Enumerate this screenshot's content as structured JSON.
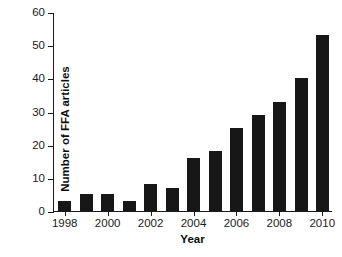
{
  "chart_data": {
    "type": "bar",
    "title": "",
    "xlabel": "Year",
    "ylabel": "Number of FFA articles",
    "categories": [
      "1998",
      "1999",
      "2000",
      "2001",
      "2002",
      "2003",
      "2004",
      "2005",
      "2006",
      "2007",
      "2008",
      "2009",
      "2010"
    ],
    "values": [
      3,
      5,
      5,
      3,
      8,
      7,
      16,
      18,
      25,
      29,
      33,
      40,
      53
    ],
    "ylim": [
      0,
      60
    ],
    "yticks": [
      0,
      10,
      20,
      30,
      40,
      50,
      60
    ],
    "ytick_labels": [
      "0",
      "10",
      "20",
      "30",
      "40",
      "50",
      "60"
    ],
    "xtick_labels": [
      "1998",
      "2000",
      "2002",
      "2004",
      "2006",
      "2008",
      "2010"
    ],
    "xtick_categories": [
      "1998",
      "2000",
      "2002",
      "2004",
      "2006",
      "2008",
      "2010"
    ],
    "grid": false,
    "legend": false,
    "bar_color": "#171717",
    "axis_color": "#1a1a1a",
    "background_color": "#ffffff"
  }
}
